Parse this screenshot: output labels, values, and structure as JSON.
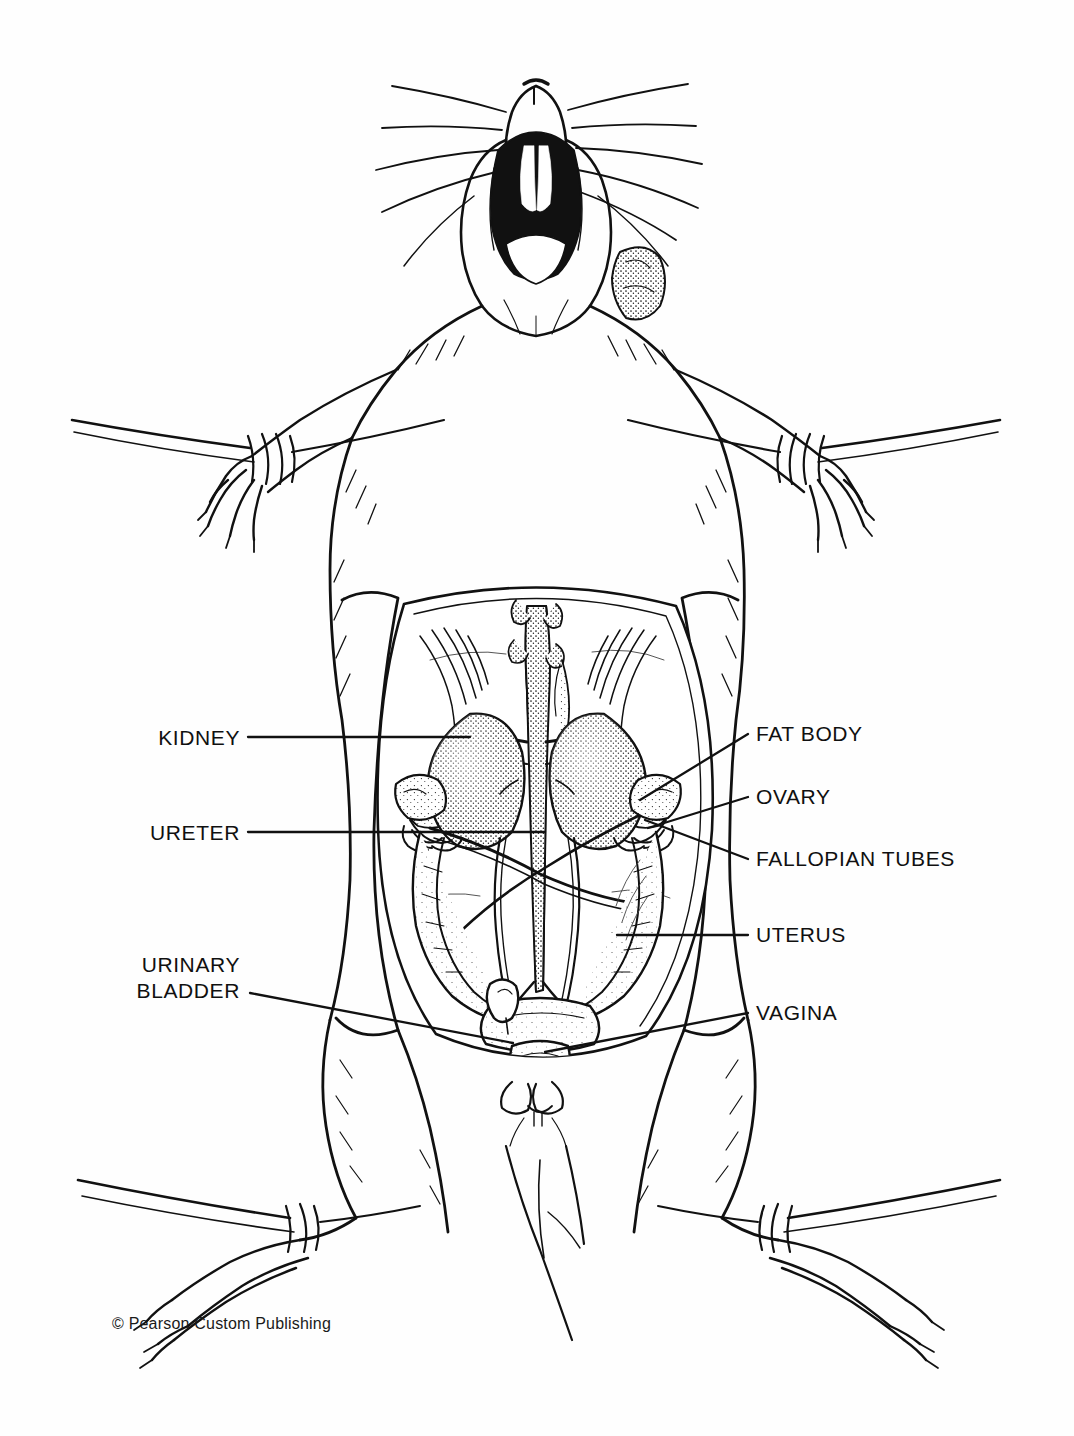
{
  "figure": {
    "credit": "© Pearson Custom Publishing",
    "ink_color": "#111111",
    "background_color": "#ffffff"
  },
  "labels": {
    "left": [
      {
        "id": "kidney",
        "text": "KIDNEY",
        "x": 160,
        "y": 726,
        "line_x1": 248,
        "line_y1": 737,
        "line_x2": 470,
        "line_y2": 737
      },
      {
        "id": "ureter",
        "text": "URETER",
        "x": 155,
        "y": 821,
        "line_x1": 248,
        "line_y1": 832,
        "line_x2": 545,
        "line_y2": 832
      },
      {
        "id": "urinary-bladder",
        "line1": "URINARY",
        "line2": "BLADDER",
        "x": 146,
        "y": 952,
        "line_x1": 250,
        "line_y1": 993,
        "line_x2": 513,
        "line_y2": 1043
      }
    ],
    "right": [
      {
        "id": "fat-body",
        "text": "FAT BODY",
        "x": 756,
        "y": 722,
        "line_x1": 748,
        "line_y1": 734,
        "line_x2": 640,
        "line_y2": 800
      },
      {
        "id": "ovary",
        "text": "OVARY",
        "x": 756,
        "y": 785,
        "line_x1": 748,
        "line_y1": 797,
        "line_x2": 648,
        "line_y2": 828
      },
      {
        "id": "fallopian-tubes",
        "text": "FALLOPIAN TUBES",
        "x": 756,
        "y": 847,
        "line_x1": 748,
        "line_y1": 859,
        "line_x2": 645,
        "line_y2": 820
      },
      {
        "id": "uterus",
        "text": "UTERUS",
        "x": 756,
        "y": 923,
        "line_x1": 748,
        "line_y1": 935,
        "line_x2": 617,
        "line_y2": 935
      },
      {
        "id": "vagina",
        "text": "VAGINA",
        "x": 756,
        "y": 1001,
        "line_x1": 748,
        "line_y1": 1013,
        "line_x2": 545,
        "line_y2": 1052
      }
    ]
  },
  "credit_pos": {
    "x": 112,
    "y": 1315
  }
}
